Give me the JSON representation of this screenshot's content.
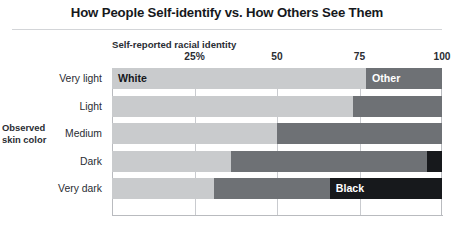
{
  "chart_data": {
    "type": "bar",
    "orientation": "horizontal",
    "stacked": true,
    "normalized": true,
    "title": "How People Self-identify vs. How Others See Them",
    "xlabel": "Self-reported racial identity",
    "ylabel": "Observed skin color",
    "categories": [
      "Very light",
      "Light",
      "Medium",
      "Dark",
      "Very dark"
    ],
    "xlim": [
      0,
      100
    ],
    "xticks": [
      0,
      25,
      50,
      75,
      100
    ],
    "xtick_labels": [
      "",
      "25%",
      "50",
      "75",
      "100"
    ],
    "grid": true,
    "legend": "none",
    "series": [
      {
        "name": "White",
        "color": "#c9cbcd",
        "values": [
          77,
          73,
          50,
          36,
          31
        ]
      },
      {
        "name": "Other",
        "color": "#6e7175",
        "values": [
          23,
          27,
          50,
          59.5,
          35
        ]
      },
      {
        "name": "Black",
        "color": "#17191c",
        "values": [
          0,
          0,
          0,
          4.5,
          34
        ]
      }
    ],
    "annotations": [
      {
        "text": "White",
        "row": 0,
        "series": "White",
        "placement": "inside-left"
      },
      {
        "text": "Other",
        "row": 0,
        "series": "Other",
        "placement": "inside-left"
      },
      {
        "text": "Black",
        "row": 4,
        "series": "Black",
        "placement": "inside-left"
      }
    ]
  },
  "header": {
    "title": "How People Self-identify vs. How Others See Them"
  },
  "axes": {
    "x_caption": "Self-reported racial identity",
    "y_caption_line1": "Observed",
    "y_caption_line2": "skin color",
    "ticks": [
      {
        "value": 0,
        "label": ""
      },
      {
        "value": 25,
        "label": "25%"
      },
      {
        "value": 50,
        "label": "50"
      },
      {
        "value": 75,
        "label": "75"
      },
      {
        "value": 100,
        "label": "100"
      }
    ]
  },
  "rows": [
    {
      "category": "Very light",
      "segments": [
        {
          "name": "White",
          "value": 77,
          "color": "#c9cbcd",
          "label": "White",
          "label_on": "light"
        },
        {
          "name": "Other",
          "value": 23,
          "color": "#6e7175",
          "label": "Other",
          "label_on": "dark"
        }
      ]
    },
    {
      "category": "Light",
      "segments": [
        {
          "name": "White",
          "value": 73,
          "color": "#c9cbcd",
          "label": "",
          "label_on": "light"
        },
        {
          "name": "Other",
          "value": 27,
          "color": "#6e7175",
          "label": "",
          "label_on": "dark"
        }
      ]
    },
    {
      "category": "Medium",
      "segments": [
        {
          "name": "White",
          "value": 50,
          "color": "#c9cbcd",
          "label": "",
          "label_on": "light"
        },
        {
          "name": "Other",
          "value": 50,
          "color": "#6e7175",
          "label": "",
          "label_on": "dark"
        }
      ]
    },
    {
      "category": "Dark",
      "segments": [
        {
          "name": "White",
          "value": 36,
          "color": "#c9cbcd",
          "label": "",
          "label_on": "light"
        },
        {
          "name": "Other",
          "value": 59.5,
          "color": "#6e7175",
          "label": "",
          "label_on": "dark"
        },
        {
          "name": "Black",
          "value": 4.5,
          "color": "#17191c",
          "label": "",
          "label_on": "dark"
        }
      ]
    },
    {
      "category": "Very dark",
      "segments": [
        {
          "name": "White",
          "value": 31,
          "color": "#c9cbcd",
          "label": "",
          "label_on": "light"
        },
        {
          "name": "Other",
          "value": 35,
          "color": "#6e7175",
          "label": "",
          "label_on": "dark"
        },
        {
          "name": "Black",
          "value": 34,
          "color": "#17191c",
          "label": "Black",
          "label_on": "dark"
        }
      ]
    }
  ],
  "colors": {
    "white_segment": "#c9cbcd",
    "other_segment": "#6e7175",
    "black_segment": "#17191c",
    "gridline": "#c9cbcf",
    "text": "#2a2d33",
    "background": "#ffffff"
  }
}
